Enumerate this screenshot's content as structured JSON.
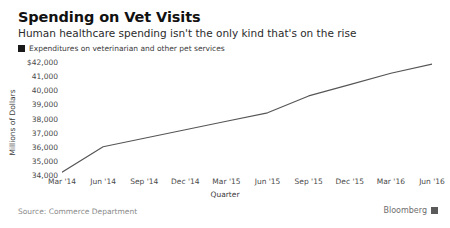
{
  "header": {
    "title": "Spending on Vet Visits",
    "subtitle": "Human healthcare spending isn't the only kind that's on the rise"
  },
  "legend": {
    "label": "Expenditures on veterinarian and other pet services",
    "swatch_color": "#1a1a1a"
  },
  "footer": {
    "source": "Source: Commerce Department",
    "brand": "Bloomberg"
  },
  "chart_data": {
    "type": "line",
    "title": "Spending on Vet Visits",
    "subtitle": "Human healthcare spending isn't the only kind that's on the rise",
    "xlabel": "Quarter",
    "ylabel": "Millions of Dollars",
    "legend_position": "top-left",
    "grid": false,
    "line_color": "#555555",
    "categories": [
      "Mar '14",
      "Jun '14",
      "Sep '14",
      "Dec '14",
      "Mar '15",
      "Jun '15",
      "Sep '15",
      "Dec '15",
      "Mar '16",
      "Jun '16"
    ],
    "series": [
      {
        "name": "Expenditures on veterinarian and other pet services",
        "values": [
          34200,
          36000,
          36600,
          37200,
          37800,
          38400,
          39600,
          40400,
          41200,
          41850
        ]
      }
    ],
    "ylim": [
      34000,
      42000
    ],
    "ytick_values": [
      34000,
      35000,
      36000,
      37000,
      38000,
      39000,
      40000,
      41000,
      42000
    ],
    "ytick_labels": [
      "34,000",
      "35,000",
      "36,000",
      "37,000",
      "38,000",
      "39,000",
      "40,000",
      "41,000",
      "$42,000"
    ]
  }
}
